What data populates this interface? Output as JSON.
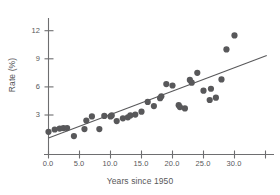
{
  "chart_data": {
    "type": "scatter",
    "title": "",
    "xlabel": "Years since 1950",
    "ylabel": "Rate (%)",
    "xlim": [
      -1.5,
      35.5
    ],
    "ylim": [
      0.0,
      13.2
    ],
    "grid": false,
    "legend": null,
    "xticks": [
      0.0,
      5.0,
      10.0,
      15.0,
      20.0,
      25.0,
      30.0
    ],
    "xtick_labels": [
      "0.0",
      "5.0",
      "10.0",
      "15.0",
      "20.0",
      "25.0",
      "30.0"
    ],
    "yticks": [
      3,
      6,
      9,
      12
    ],
    "ytick_labels": [
      "3",
      "6",
      "9",
      "12"
    ],
    "point_color": "#58585a",
    "line_color": "#58585a",
    "axis_color": "#6e6e70",
    "marker_size": 3.1,
    "x": [
      0.0,
      1.0,
      1.8,
      2.4,
      3.0,
      4.1,
      5.8,
      6.1,
      7.0,
      8.2,
      9.0,
      10.0,
      10.2,
      11.0,
      12.0,
      12.8,
      13.2,
      14.0,
      15.0,
      16.0,
      17.0,
      18.0,
      18.2,
      19.0,
      20.0,
      21.0,
      21.2,
      22.0,
      22.8,
      23.1,
      24.0,
      25.0,
      26.0,
      26.2,
      27.0,
      27.9,
      28.7,
      30.0
    ],
    "y": [
      1.2,
      1.45,
      1.55,
      1.6,
      1.6,
      0.75,
      1.5,
      2.4,
      2.85,
      1.5,
      2.9,
      2.85,
      2.95,
      2.35,
      2.65,
      2.75,
      2.95,
      3.05,
      3.35,
      4.4,
      3.95,
      4.8,
      5.0,
      6.3,
      6.15,
      4.05,
      3.85,
      3.7,
      6.75,
      6.45,
      7.5,
      5.6,
      4.6,
      5.8,
      4.85,
      6.8,
      10.0,
      11.5
    ],
    "trendline": {
      "label": "least-squares regression line",
      "x_start": 0.0,
      "y_start": 0.55,
      "x_end": 35.2,
      "y_end": 9.35
    }
  }
}
